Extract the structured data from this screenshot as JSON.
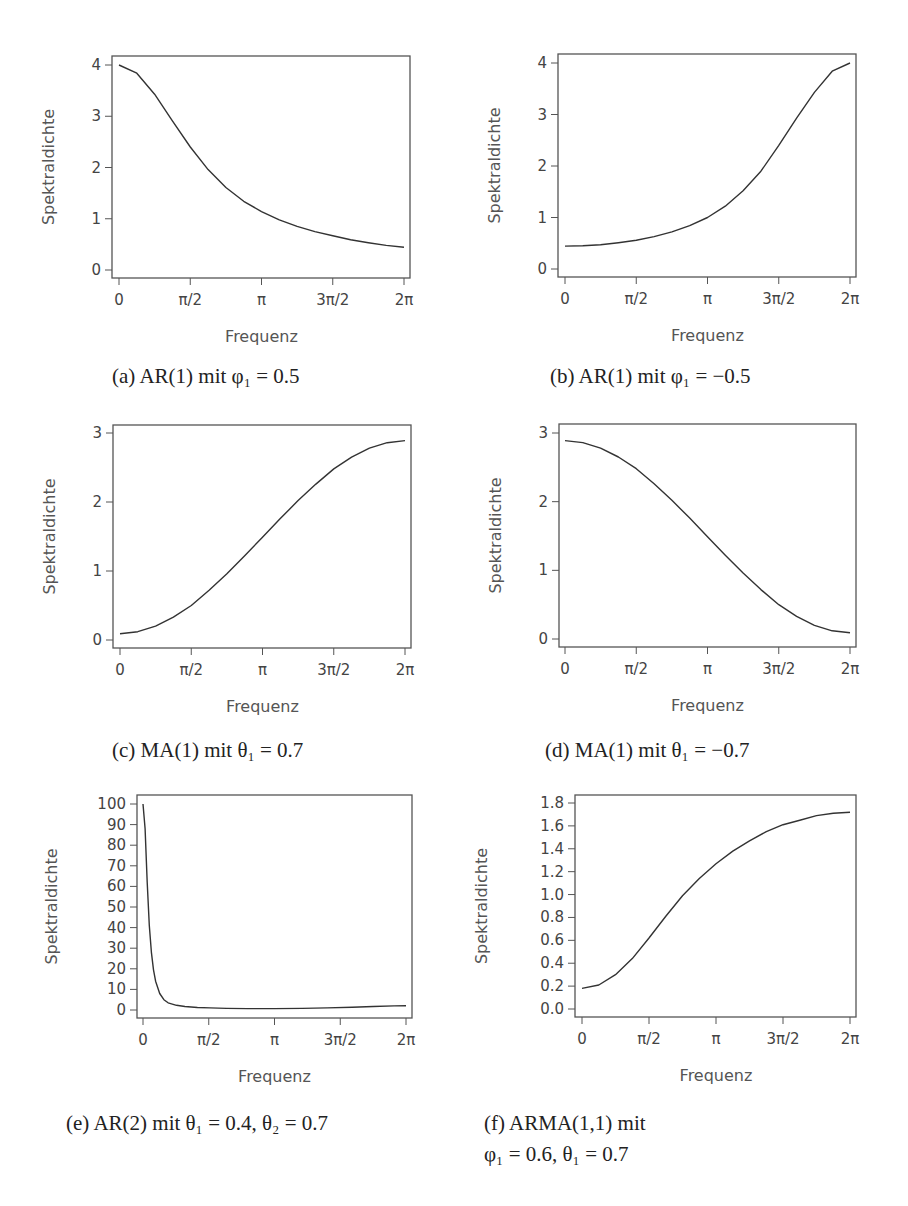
{
  "chart_data": [
    {
      "id": "a",
      "type": "line",
      "caption": "(a) AR(1) mit φ₁ = 0.5",
      "xlabel": "Frequenz",
      "ylabel": "Spektraldichte",
      "xticks": [
        "0",
        "π/2",
        "π",
        "3π/2",
        "2π"
      ],
      "yticks": [
        "0",
        "1",
        "2",
        "3",
        "4"
      ],
      "ylim": [
        0,
        4
      ],
      "xlim": [
        0,
        6.2832
      ],
      "grid": false,
      "series": [
        {
          "name": "AR(1) phi1=0.5",
          "x": [
            0,
            0.3927,
            0.7854,
            1.1781,
            1.5708,
            1.9635,
            2.3562,
            2.7489,
            3.1416,
            3.5343,
            3.927,
            4.3197,
            4.7124,
            5.1051,
            5.4978,
            5.8905,
            6.2832
          ],
          "values": [
            4.0,
            3.84,
            3.43,
            2.91,
            2.4,
            1.96,
            1.61,
            1.34,
            1.14,
            0.98,
            0.85,
            0.75,
            0.67,
            0.59,
            0.53,
            0.48,
            0.444
          ]
        }
      ]
    },
    {
      "id": "b",
      "type": "line",
      "caption": "(b) AR(1) mit φ₁ = −0.5",
      "xlabel": "Frequenz",
      "ylabel": "Spektraldichte",
      "xticks": [
        "0",
        "π/2",
        "π",
        "3π/2",
        "2π"
      ],
      "yticks": [
        "0",
        "1",
        "2",
        "3",
        "4"
      ],
      "ylim": [
        0,
        4
      ],
      "xlim": [
        0,
        6.2832
      ],
      "grid": false,
      "series": [
        {
          "name": "AR(1) phi1=-0.5",
          "x": [
            0,
            0.3927,
            0.7854,
            1.1781,
            1.5708,
            1.9635,
            2.3562,
            2.7489,
            3.1416,
            3.5343,
            3.927,
            4.3197,
            4.7124,
            5.1051,
            5.4978,
            5.8905,
            6.2832
          ],
          "values": [
            0.444,
            0.45,
            0.47,
            0.51,
            0.56,
            0.63,
            0.72,
            0.84,
            1.0,
            1.22,
            1.52,
            1.9,
            2.4,
            2.93,
            3.43,
            3.84,
            4.0
          ]
        }
      ]
    },
    {
      "id": "c",
      "type": "line",
      "caption": "(c) MA(1) mit θ₁ = 0.7",
      "xlabel": "Frequenz",
      "ylabel": "Spektraldichte",
      "xticks": [
        "0",
        "π/2",
        "π",
        "3π/2",
        "2π"
      ],
      "yticks": [
        "0",
        "1",
        "2",
        "3"
      ],
      "ylim": [
        0,
        3
      ],
      "xlim": [
        0,
        6.2832
      ],
      "grid": false,
      "series": [
        {
          "name": "MA(1) theta1=0.7",
          "x": [
            0,
            0.3927,
            0.7854,
            1.1781,
            1.5708,
            1.9635,
            2.3562,
            2.7489,
            3.1416,
            3.5343,
            3.927,
            4.3197,
            4.7124,
            5.1051,
            5.4978,
            5.8905,
            6.2832
          ],
          "values": [
            0.09,
            0.12,
            0.2,
            0.33,
            0.5,
            0.72,
            0.96,
            1.22,
            1.49,
            1.76,
            2.02,
            2.26,
            2.48,
            2.65,
            2.78,
            2.86,
            2.89
          ]
        }
      ]
    },
    {
      "id": "d",
      "type": "line",
      "caption": "(d) MA(1) mit θ₁ = −0.7",
      "xlabel": "Frequenz",
      "ylabel": "Spektraldichte",
      "xticks": [
        "0",
        "π/2",
        "π",
        "3π/2",
        "2π"
      ],
      "yticks": [
        "0",
        "1",
        "2",
        "3"
      ],
      "ylim": [
        0,
        3
      ],
      "xlim": [
        0,
        6.2832
      ],
      "grid": false,
      "series": [
        {
          "name": "MA(1) theta1=-0.7",
          "x": [
            0,
            0.3927,
            0.7854,
            1.1781,
            1.5708,
            1.9635,
            2.3562,
            2.7489,
            3.1416,
            3.5343,
            3.927,
            4.3197,
            4.7124,
            5.1051,
            5.4978,
            5.8905,
            6.2832
          ],
          "values": [
            2.89,
            2.86,
            2.78,
            2.65,
            2.48,
            2.26,
            2.02,
            1.76,
            1.49,
            1.22,
            0.96,
            0.72,
            0.5,
            0.33,
            0.2,
            0.12,
            0.09
          ]
        }
      ]
    },
    {
      "id": "e",
      "type": "line",
      "caption": "(e) AR(2) mit θ₁ = 0.4,  θ₂ = 0.7",
      "xlabel": "Frequenz",
      "ylabel": "Spektraldichte",
      "xticks": [
        "0",
        "π/2",
        "π",
        "3π/2",
        "2π"
      ],
      "yticks": [
        "0",
        "10",
        "20",
        "30",
        "40",
        "50",
        "60",
        "70",
        "80",
        "90",
        "100"
      ],
      "ylim": [
        0,
        100
      ],
      "xlim": [
        0,
        6.2832
      ],
      "grid": false,
      "series": [
        {
          "name": "AR(2) theta1=0.4 theta2=0.7",
          "x": [
            0,
            0.05,
            0.1,
            0.15,
            0.2,
            0.25,
            0.3,
            0.4,
            0.5,
            0.6,
            0.8,
            1.0,
            1.3,
            1.6,
            2.0,
            2.5,
            3.1416,
            3.8,
            4.4,
            5.0,
            5.5,
            6.0,
            6.2832
          ],
          "values": [
            100,
            88,
            62,
            41,
            28,
            19.5,
            14,
            8,
            5,
            3.5,
            2.3,
            1.7,
            1.2,
            1.0,
            0.8,
            0.7,
            0.7,
            0.8,
            1.0,
            1.3,
            1.7,
            2.0,
            2.1
          ]
        }
      ]
    },
    {
      "id": "f",
      "type": "line",
      "caption_line1": "(f) ARMA(1,1) mit",
      "caption_line2": "φ₁ = 0.6,  θ₁ = 0.7",
      "xlabel": "Frequenz",
      "ylabel": "Spektraldichte",
      "xticks": [
        "0",
        "π/2",
        "π",
        "3π/2",
        "2π"
      ],
      "yticks": [
        "0.0",
        "0.2",
        "0.4",
        "0.6",
        "0.8",
        "1.0",
        "1.2",
        "1.4",
        "1.6",
        "1.8"
      ],
      "ylim": [
        0,
        1.8
      ],
      "xlim": [
        0,
        6.2832
      ],
      "grid": false,
      "series": [
        {
          "name": "ARMA(1,1) phi1=0.6 theta1=0.7",
          "x": [
            0,
            0.3927,
            0.7854,
            1.1781,
            1.5708,
            1.9635,
            2.3562,
            2.7489,
            3.1416,
            3.5343,
            3.927,
            4.3197,
            4.7124,
            5.1051,
            5.4978,
            5.8905,
            6.2832
          ],
          "values": [
            0.18,
            0.21,
            0.3,
            0.44,
            0.62,
            0.81,
            0.99,
            1.14,
            1.27,
            1.38,
            1.47,
            1.55,
            1.61,
            1.65,
            1.69,
            1.71,
            1.72
          ]
        }
      ]
    }
  ],
  "layout": {
    "panels": {
      "a": {
        "fx0": 112,
        "fy0": 56,
        "fx1": 410,
        "fy1": 278,
        "px0": 119,
        "px1": 404,
        "py0": 270,
        "py1": 65
      },
      "b": {
        "fx0": 558,
        "fy0": 54,
        "fx1": 856,
        "fy1": 277,
        "px0": 565,
        "px1": 850,
        "py0": 269,
        "py1": 63
      },
      "c": {
        "fx0": 113,
        "fy0": 425,
        "fx1": 411,
        "fy1": 648,
        "px0": 120,
        "px1": 405,
        "py0": 640,
        "py1": 433
      },
      "d": {
        "fx0": 559,
        "fy0": 424,
        "fx1": 856,
        "fy1": 647,
        "px0": 565,
        "px1": 850,
        "py0": 639,
        "py1": 433
      },
      "e": {
        "fx0": 137,
        "fy0": 795,
        "fx1": 412,
        "fy1": 1018,
        "px0": 143,
        "px1": 406,
        "py0": 1010,
        "py1": 804
      },
      "f": {
        "fx0": 575,
        "fy0": 795,
        "fx1": 856,
        "fy1": 1017,
        "px0": 582,
        "px1": 850,
        "py0": 1009,
        "py1": 803
      }
    },
    "line_color": "#333333",
    "frame_color": "#555555"
  }
}
